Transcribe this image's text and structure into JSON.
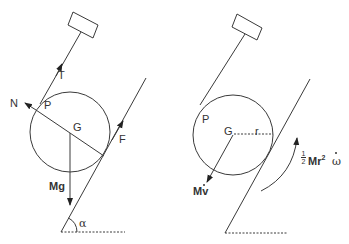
{
  "figure": {
    "panels": [
      {
        "id": "free-body-diagram",
        "labels": {
          "tension": "T",
          "normal": "N",
          "contact_point": "P",
          "center": "G",
          "friction": "F",
          "weight": "Mg",
          "angle": "α"
        }
      },
      {
        "id": "kinetic-diagram",
        "labels": {
          "contact_point": "P",
          "center": "G",
          "radius": "r",
          "linear_inertia": "Mv",
          "rotational_inertia_coeff_num": "1",
          "rotational_inertia_coeff_den": "2",
          "rotational_inertia_body": "Mr",
          "rotational_inertia_exp": "2",
          "rotational_inertia_var": "ω"
        }
      }
    ],
    "colors": {
      "line": "#3a3a3a",
      "text": "#333333",
      "background": "#ffffff"
    }
  }
}
